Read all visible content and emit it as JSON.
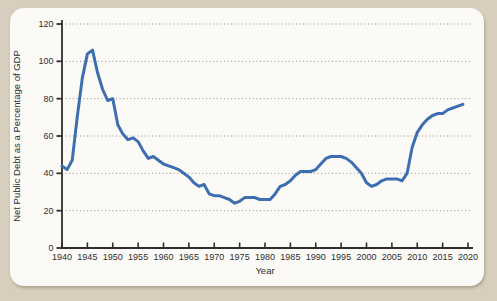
{
  "figure": {
    "background_color": "#d7cebd",
    "card_color": "#fbfaf6",
    "axis_color": "#2e2e2e",
    "grid_color": "#8f8f8f",
    "line_color": "#3d6eb0"
  },
  "chart_data": {
    "type": "line",
    "title": "",
    "xlabel": "Year",
    "ylabel": "Net Public Debt as a Percentage of GDP",
    "xlim": [
      1940,
      2020
    ],
    "ylim": [
      0,
      120
    ],
    "x_ticks": [
      1940,
      1945,
      1950,
      1955,
      1960,
      1965,
      1970,
      1975,
      1980,
      1985,
      1990,
      1995,
      2000,
      2005,
      2010,
      2015,
      2020
    ],
    "y_ticks": [
      0,
      20,
      40,
      60,
      80,
      100,
      120
    ],
    "grid": "horizontal-dotted",
    "legend": "none",
    "series": [
      {
        "name": "Net public debt as a percentage of GDP",
        "x": [
          1940,
          1941,
          1942,
          1943,
          1944,
          1945,
          1946,
          1947,
          1948,
          1949,
          1950,
          1951,
          1952,
          1953,
          1954,
          1955,
          1956,
          1957,
          1958,
          1959,
          1960,
          1961,
          1962,
          1963,
          1964,
          1965,
          1966,
          1967,
          1968,
          1969,
          1970,
          1971,
          1972,
          1973,
          1974,
          1975,
          1976,
          1977,
          1978,
          1979,
          1980,
          1981,
          1982,
          1983,
          1984,
          1985,
          1986,
          1987,
          1988,
          1989,
          1990,
          1991,
          1992,
          1993,
          1994,
          1995,
          1996,
          1997,
          1998,
          1999,
          2000,
          2001,
          2002,
          2003,
          2004,
          2005,
          2006,
          2007,
          2008,
          2009,
          2010,
          2011,
          2012,
          2013,
          2014,
          2015,
          2016,
          2017,
          2018,
          2019
        ],
        "values": [
          44,
          42,
          47,
          70,
          91,
          104,
          106,
          94,
          85,
          79,
          80,
          66,
          61,
          58,
          59,
          57,
          52,
          48,
          49,
          47,
          45,
          44,
          43,
          42,
          40,
          38,
          35,
          33,
          34,
          29,
          28,
          28,
          27,
          26,
          24,
          25,
          27,
          27,
          27,
          26,
          26,
          26,
          29,
          33,
          34,
          36,
          39,
          41,
          41,
          41,
          42,
          45,
          48,
          49,
          49,
          49,
          48,
          46,
          43,
          40,
          35,
          33,
          34,
          36,
          37,
          37,
          37,
          36,
          40,
          54,
          62,
          66,
          69,
          71,
          72,
          72,
          74,
          75,
          76,
          77
        ]
      }
    ]
  }
}
